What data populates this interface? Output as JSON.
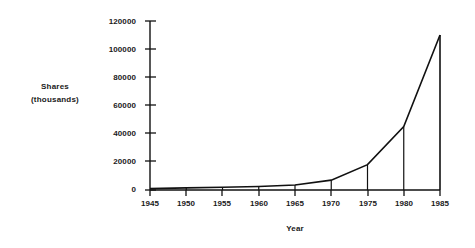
{
  "chart_data": {
    "type": "line",
    "title": "",
    "subtitle": "",
    "xlabel": "Year",
    "ylabel": "Shares\n(thousands)",
    "ylabel_lines": [
      "Shares",
      "(thousands)"
    ],
    "x": [
      1945,
      1950,
      1955,
      1960,
      1965,
      1970,
      1975,
      1980,
      1985
    ],
    "categories": [
      "1945",
      "1950",
      "1955",
      "1960",
      "1965",
      "1970",
      "1975",
      "1980",
      "1985"
    ],
    "values": [
      1000,
      1500,
      2000,
      2500,
      3500,
      7000,
      18000,
      45000,
      110000
    ],
    "series": [
      {
        "name": "Shares (thousands)",
        "values": [
          1000,
          1500,
          2000,
          2500,
          3500,
          7000,
          18000,
          45000,
          110000
        ]
      }
    ],
    "xlim": [
      1945,
      1985
    ],
    "ylim": [
      0,
      120000
    ],
    "xticks": [
      1945,
      1950,
      1955,
      1960,
      1965,
      1970,
      1975,
      1980,
      1985
    ],
    "yticks": [
      0,
      20000,
      40000,
      60000,
      80000,
      100000,
      120000
    ],
    "ytick_labels": [
      "0",
      "20000",
      "40000",
      "60000",
      "80000",
      "100000",
      "120000"
    ],
    "xtick_labels": [
      "1945",
      "1950",
      "1955",
      "1960",
      "1965",
      "1970",
      "1975",
      "1980",
      "1985"
    ],
    "grid": false,
    "legend": false,
    "legend_position": "none",
    "drop_lines": true,
    "annotations": [],
    "line_color": "#111111",
    "axis_color": "#111111",
    "background_color": "#ffffff"
  }
}
